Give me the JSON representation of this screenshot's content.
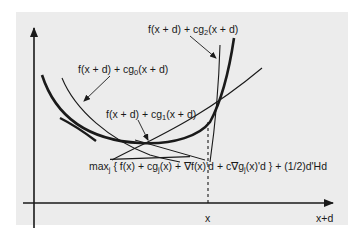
{
  "figure": {
    "axes": {
      "x_label": "x+d",
      "x_tick_label": "x"
    },
    "labels": {
      "g2": {
        "prefix": "f(x + d) + cg",
        "sub": "2",
        "suffix": "(x + d)"
      },
      "g0": {
        "prefix": "f(x + d) + cg",
        "sub": "0",
        "suffix": "(x + d)"
      },
      "g1": {
        "prefix": "f(x + d) + cg",
        "sub": "1",
        "suffix": "(x + d)"
      },
      "model": {
        "p1": "max",
        "p1_sub": "j",
        "p2": " { f(x) + cg",
        "p2_sub": "j",
        "p3": "(x) + ∇f(x)'d +  c∇g",
        "p3_sub": "j",
        "p4": "(x)'d } + (1/2)d'Hd"
      }
    },
    "colors": {
      "background": "#ffffff",
      "panel": "#ececec",
      "ink": "#1a1a1a"
    }
  }
}
